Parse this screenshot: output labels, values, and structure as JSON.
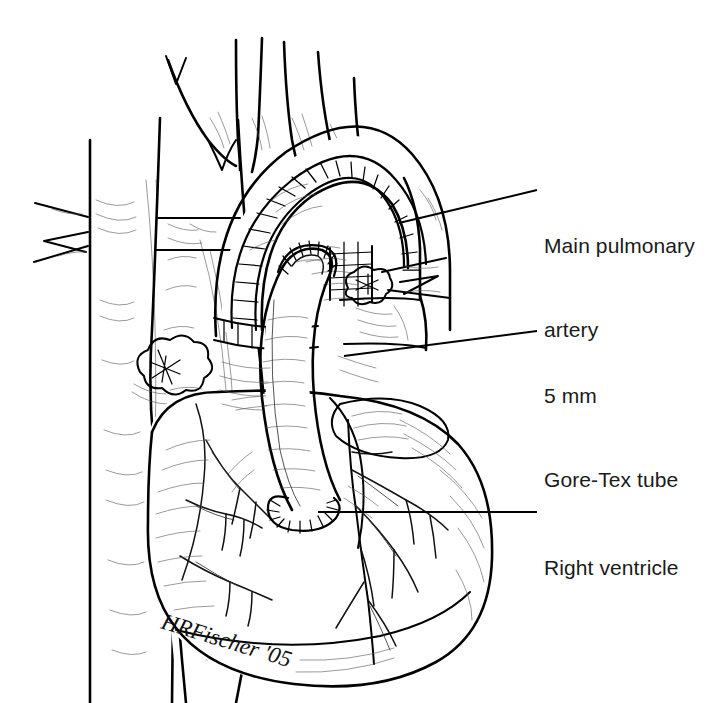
{
  "figure": {
    "type": "medical-line-illustration",
    "background_color": "#ffffff",
    "ink_color": "#000000",
    "hatch_color": "#3a3a3a",
    "text_color": "#1a1a1a",
    "width": 716,
    "height": 703
  },
  "annotations": [
    {
      "id": "main-pulmonary-artery",
      "line1": "Main pulmonary",
      "line2": "artery",
      "leader": {
        "x1": 399,
        "y1": 223,
        "x2": 537,
        "y2": 190
      }
    },
    {
      "id": "gore-tex-tube",
      "line1": "5 mm",
      "line2": "Gore-Tex tube",
      "leader": {
        "x1": 344,
        "y1": 356,
        "x2": 537,
        "y2": 331
      }
    },
    {
      "id": "right-ventricle",
      "line1": "Right ventricle",
      "line2": "",
      "leader": {
        "x1": 318,
        "y1": 512,
        "x2": 537,
        "y2": 512
      }
    }
  ],
  "signature": {
    "text": "HRFischer '05",
    "x": 160,
    "y": 628,
    "rotation": 17
  }
}
